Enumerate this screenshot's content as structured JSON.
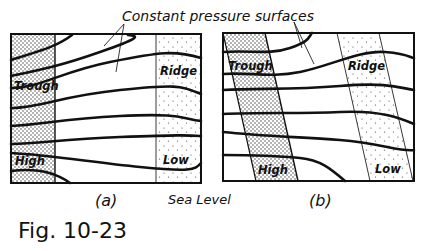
{
  "title": "Constant pressure surfaces",
  "panels": [
    {
      "id": "a",
      "caption": "(a)",
      "labels": {
        "trough": "Trough",
        "ridge": "Ridge",
        "high": "High",
        "low": "Low"
      }
    },
    {
      "id": "b",
      "caption": "(b)",
      "labels": {
        "trough": "Trough",
        "ridge": "Ridge",
        "high": "High",
        "low": "Low"
      }
    }
  ],
  "sea_level": "Sea Level",
  "figure_label": "Fig. 10-23",
  "colors": {
    "ink": "#111111",
    "background": "#ffffff"
  }
}
